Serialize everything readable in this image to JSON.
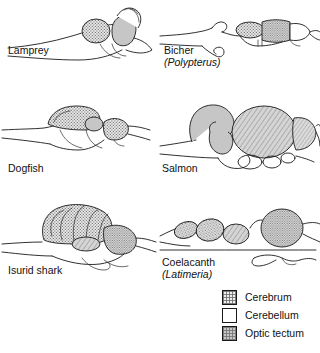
{
  "figure": {
    "title": "Comparative fish brain anatomy",
    "panels": [
      {
        "id": "lamprey",
        "common_name": "Lamprey",
        "scientific_name": ""
      },
      {
        "id": "bicher",
        "common_name": "Bicher",
        "scientific_name": "(Polypterus)"
      },
      {
        "id": "dogfish",
        "common_name": "Dogfish",
        "scientific_name": ""
      },
      {
        "id": "salmon",
        "common_name": "Salmon",
        "scientific_name": ""
      },
      {
        "id": "isurid-shark",
        "common_name": "Isurid shark",
        "scientific_name": ""
      },
      {
        "id": "coelacanth",
        "common_name": "Coelacanth",
        "scientific_name": "(Latimeria)"
      }
    ]
  },
  "legend": {
    "items": [
      {
        "key": "cerebrum",
        "label": "Cerebrum",
        "pattern": "stipple-hatch",
        "color": "#d8d8d8"
      },
      {
        "key": "cerebellum",
        "label": "Cerebellum",
        "pattern": "plain-white",
        "color": "#ffffff"
      },
      {
        "key": "optic-tectum",
        "label": "Optic tectum",
        "pattern": "grey-stipple",
        "color": "#bdbdbd"
      }
    ]
  },
  "colors": {
    "outline": "#1a1a1a",
    "grey_fill": "#bfbfbf",
    "white_fill": "#ffffff",
    "background": "#ffffff"
  }
}
